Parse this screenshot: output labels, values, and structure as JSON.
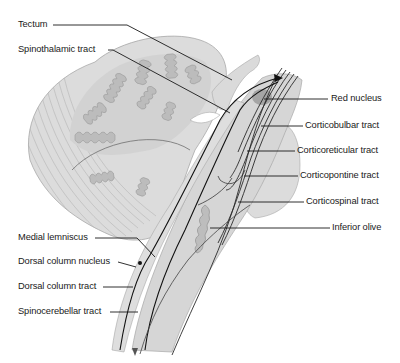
{
  "diagram": {
    "colors": {
      "tissue_fill": "#d9d9d9",
      "tissue_stroke": "#a6a6a6",
      "folia_fill": "#bdbdbd",
      "red_nucleus": "#a3a3a3",
      "tract_line": "#1a1a1a",
      "leader_line": "#1a1a1a",
      "background": "#ffffff"
    },
    "labels_left": [
      {
        "id": "tectum",
        "text": "Tectum"
      },
      {
        "id": "spinothalamic",
        "text": "Spinothalamic tract"
      },
      {
        "id": "medial-lemniscus",
        "text": "Medial lemniscus"
      },
      {
        "id": "dorsal-column-nucleus",
        "text": "Dorsal column nucleus"
      },
      {
        "id": "dorsal-column-tract",
        "text": "Dorsal column tract"
      },
      {
        "id": "spinocerebellar",
        "text": "Spinocerebellar tract"
      }
    ],
    "labels_right": [
      {
        "id": "red-nucleus",
        "text": "Red nucleus"
      },
      {
        "id": "corticobulbar",
        "text": "Corticobulbar tract"
      },
      {
        "id": "corticoreticular",
        "text": "Corticoreticular tract"
      },
      {
        "id": "corticopontine",
        "text": "Corticopontine tract"
      },
      {
        "id": "corticospinal",
        "text": "Corticospinal tract"
      },
      {
        "id": "inferior-olive",
        "text": "Inferior olive"
      }
    ]
  }
}
